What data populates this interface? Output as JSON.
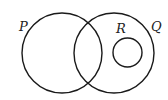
{
  "diagram": {
    "type": "venn",
    "stroke_color": "#1a1a1a",
    "background": "#ffffff",
    "sets": [
      {
        "id": "P",
        "label": "P",
        "cx": 62,
        "cy": 53,
        "r": 40,
        "label_x": 19,
        "label_y": 31
      },
      {
        "id": "Q",
        "label": "Q",
        "cx": 114,
        "cy": 53,
        "r": 40,
        "label_x": 151,
        "label_y": 31
      },
      {
        "id": "R",
        "label": "R",
        "cx": 127.5,
        "cy": 52.5,
        "r": 14.5,
        "label_x": 116,
        "label_y": 33
      }
    ],
    "relations": [
      "P and Q overlap",
      "R is a subset of Q",
      "R is disjoint from P"
    ]
  }
}
